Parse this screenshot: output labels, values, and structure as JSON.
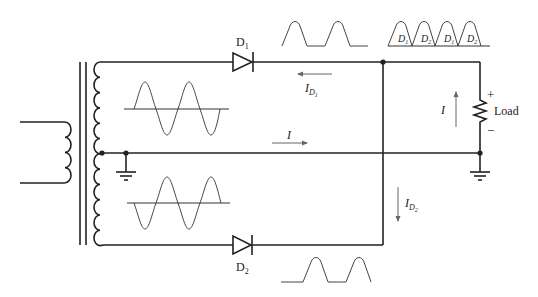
{
  "diagram": {
    "labels": {
      "d1": "D",
      "d1_sub": "1",
      "d2": "D",
      "d2_sub": "2",
      "id1": "I",
      "id1_sub": "D",
      "id1_subsub": "1",
      "id2": "I",
      "id2_sub": "D",
      "id2_subsub": "2",
      "i_center": "I",
      "i_load": "I",
      "load": "Load",
      "plus": "+",
      "minus": "−"
    },
    "output_waveform_labels": [
      "D1",
      "D2",
      "D1",
      "D2"
    ],
    "output_waveform_label_parts": [
      {
        "main": "D",
        "sub": "1"
      },
      {
        "main": "D",
        "sub": "2"
      },
      {
        "main": "D",
        "sub": "1"
      },
      {
        "main": "D",
        "sub": "2"
      }
    ],
    "components": [
      "transformer-primary",
      "transformer-core",
      "transformer-secondary-center-tapped",
      "diode-D1",
      "diode-D2",
      "load-resistor",
      "ground-center-tap",
      "ground-load"
    ],
    "colors": {
      "wire": "#222222",
      "waveform": "#444444",
      "arrow": "#666666",
      "background": "#ffffff"
    }
  }
}
